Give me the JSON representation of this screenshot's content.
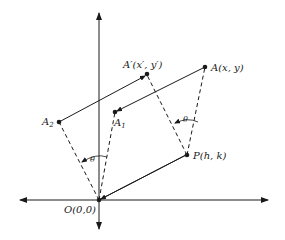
{
  "diagram": {
    "type": "rotation-about-point",
    "axes": {
      "origin_label": "O(0,0)"
    },
    "points": {
      "origin": {
        "label": "O(0,0)"
      },
      "A": {
        "label": "A(x, y)"
      },
      "A_prime": {
        "label": "A′(x′, y′)"
      },
      "A1": {
        "label": "A",
        "sub": "1"
      },
      "A2": {
        "label": "A",
        "sub": "2"
      },
      "P": {
        "label": "P(h, k)"
      }
    },
    "angles": [
      {
        "label": "θ",
        "at": "P"
      },
      {
        "label": "θ",
        "at": "O"
      }
    ]
  }
}
